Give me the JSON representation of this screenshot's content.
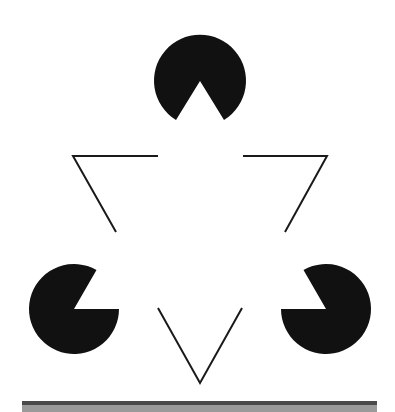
{
  "figure": {
    "name": "Kanizsa triangle illusion",
    "background": "#ffffff",
    "fill_color": "#111111",
    "stroke_color": "#1a1a1a",
    "pacmen": [
      {
        "id": "top",
        "cx": 200,
        "cy": 80,
        "r": 46,
        "mouth_apex": [
          200,
          81
        ],
        "mouth_p1": [
          176,
          122
        ],
        "mouth_p2": [
          224,
          122
        ]
      },
      {
        "id": "bottom-left",
        "cx": 74,
        "cy": 309,
        "r": 45,
        "mouth": "opening toward upper-right"
      },
      {
        "id": "bottom-right",
        "cx": 326,
        "cy": 309,
        "r": 45,
        "mouth": "opening toward upper-left"
      }
    ],
    "outline_corners": [
      {
        "id": "left",
        "points": [
          [
            158,
            156
          ],
          [
            73,
            156
          ],
          [
            116,
            232
          ]
        ]
      },
      {
        "id": "right",
        "points": [
          [
            243,
            156
          ],
          [
            327,
            156
          ],
          [
            285,
            232
          ]
        ]
      },
      {
        "id": "bottom",
        "points": [
          [
            158,
            308
          ],
          [
            200,
            383
          ],
          [
            242,
            308
          ]
        ]
      }
    ],
    "base_bar": {
      "dark": "#4a4a4a",
      "light": "#9a9a9a"
    }
  }
}
